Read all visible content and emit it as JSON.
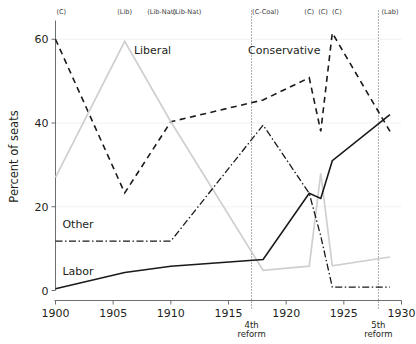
{
  "chart_data": {
    "type": "line",
    "title": "",
    "xlabel": "",
    "ylabel": "Percent of seats",
    "xlim": [
      1900,
      1930
    ],
    "ylim": [
      0,
      64
    ],
    "xticks": [
      1900,
      1905,
      1910,
      1915,
      1920,
      1925,
      1930
    ],
    "yticks": [
      0,
      20,
      40,
      60
    ],
    "grid": "faint-horizontal",
    "legend": "inline-labels",
    "series": [
      {
        "name": "Conservative",
        "style": "dashed",
        "color": "#1a1a1a",
        "x": [
          1900,
          1906,
          1910,
          1918,
          1922,
          1923,
          1924,
          1929
        ],
        "values": [
          60.0,
          23.3,
          40.3,
          45.5,
          50.8,
          38.0,
          61.5,
          38.0
        ]
      },
      {
        "name": "Liberal",
        "style": "solid-light",
        "color": "#cfcfcf",
        "x": [
          1900,
          1906,
          1910,
          1918,
          1922,
          1923,
          1924,
          1929
        ],
        "values": [
          27.0,
          59.5,
          40.3,
          4.8,
          5.8,
          28.0,
          5.9,
          8.0
        ]
      },
      {
        "name": "Other",
        "style": "dash-dot",
        "color": "#1a1a1a",
        "x": [
          1900,
          1906,
          1910,
          1918,
          1922,
          1923,
          1924,
          1929
        ],
        "values": [
          11.8,
          11.8,
          11.8,
          39.5,
          23.2,
          13.0,
          0.8,
          0.8
        ]
      },
      {
        "name": "Labor",
        "style": "solid",
        "color": "#1a1a1a",
        "x": [
          1900,
          1906,
          1910,
          1918,
          1922,
          1923,
          1924,
          1929
        ],
        "values": [
          0.4,
          4.3,
          5.8,
          7.4,
          23.2,
          22.0,
          31.0,
          42.0
        ]
      }
    ],
    "series_labels": [
      {
        "text": "Liberal",
        "x": 1906.8,
        "y": 56.5
      },
      {
        "text": "Conservative",
        "x": 1916.7,
        "y": 56.5
      },
      {
        "text": "Other",
        "x": 1900.6,
        "y": 15.0
      },
      {
        "text": "Labor",
        "x": 1900.6,
        "y": 3.6
      }
    ],
    "top_annotations": [
      {
        "text": "(C)",
        "x": 1900.5
      },
      {
        "text": "(Lib)",
        "x": 1906.0
      },
      {
        "text": "(Lib-Nat)",
        "x": 1909.2
      },
      {
        "text": "(Lib-Nat)",
        "x": 1911.4
      },
      {
        "text": "(C-Coal)",
        "x": 1918.2
      },
      {
        "text": "(C)",
        "x": 1922.0
      },
      {
        "text": "(C)",
        "x": 1923.2
      },
      {
        "text": "(C)",
        "x": 1924.4
      },
      {
        "text": "(Lab)",
        "x": 1929.0
      }
    ],
    "reform_markers": [
      {
        "label_line1": "4th",
        "label_line2": "reform",
        "x": 1917.0
      },
      {
        "label_line1": "5th",
        "label_line2": "reform",
        "x": 1928.0
      }
    ]
  },
  "colors": {
    "background": "#ffffff",
    "axis": "#6d6e71",
    "text": "#231f20",
    "liberal": "#cfcfcf",
    "dark": "#1a1a1a",
    "grid": "#f2f2f2"
  }
}
